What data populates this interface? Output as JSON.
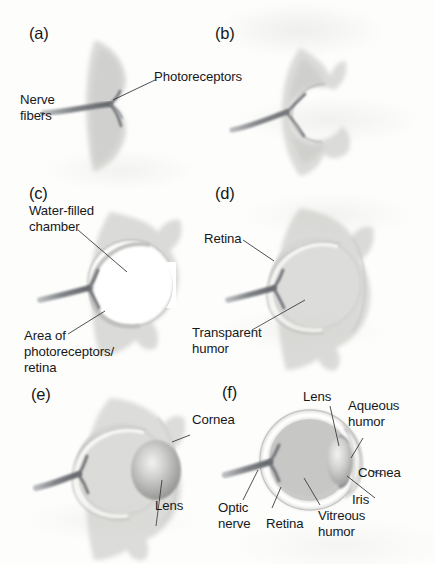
{
  "figure": {
    "background_color": "#fdfdfc",
    "ink_color": "#16181a",
    "tissue_color": "#d8d8d6",
    "nerve_color": "#6f7276"
  },
  "panels": [
    {
      "id": "a",
      "letter": "(a)",
      "stage": "flat patch of photoreceptors",
      "labels": [
        {
          "name": "nerve-fibers",
          "text": "Nerve\nfibers"
        },
        {
          "name": "photoreceptors",
          "text": "Photoreceptors"
        }
      ]
    },
    {
      "id": "b",
      "letter": "(b)",
      "stage": "cupped photoreceptor sheet",
      "labels": []
    },
    {
      "id": "c",
      "letter": "(c)",
      "stage": "pinhole eye with water-filled chamber",
      "labels": [
        {
          "name": "water-filled-chamber",
          "text": "Water-filled\nchamber"
        },
        {
          "name": "area-of-photoreceptors-retina",
          "text": "Area of\nphotoreceptors/\nretina"
        }
      ]
    },
    {
      "id": "d",
      "letter": "(d)",
      "stage": "chamber filled with transparent humor",
      "labels": [
        {
          "name": "retina",
          "text": "Retina"
        },
        {
          "name": "transparent-humor",
          "text": "Transparent\nhumor"
        }
      ]
    },
    {
      "id": "e",
      "letter": "(e)",
      "stage": "eye with lens and cornea",
      "labels": [
        {
          "name": "cornea",
          "text": "Cornea"
        },
        {
          "name": "lens",
          "text": "Lens"
        }
      ]
    },
    {
      "id": "f",
      "letter": "(f)",
      "stage": "complex camera eye",
      "labels": [
        {
          "name": "lens",
          "text": "Lens"
        },
        {
          "name": "aqueous-humor",
          "text": "Aqueous\nhumor"
        },
        {
          "name": "cornea",
          "text": "Cornea"
        },
        {
          "name": "iris",
          "text": "Iris"
        },
        {
          "name": "vitreous-humor",
          "text": "Vitreous\nhumor"
        },
        {
          "name": "retina",
          "text": "Retina"
        },
        {
          "name": "optic-nerve",
          "text": "Optic\nnerve"
        }
      ]
    }
  ],
  "text": {
    "a_letter": "(a)",
    "b_letter": "(b)",
    "c_letter": "(c)",
    "d_letter": "(d)",
    "e_letter": "(e)",
    "f_letter": "(f)",
    "nerve_fibers_l1": "Nerve",
    "nerve_fibers_l2": "fibers",
    "photoreceptors": "Photoreceptors",
    "water_filled_l1": "Water-filled",
    "water_filled_l2": "chamber",
    "area_of_l1": "Area of",
    "area_of_l2": "photoreceptors/",
    "area_of_l3": "retina",
    "retina_d": "Retina",
    "transparent_l1": "Transparent",
    "transparent_l2": "humor",
    "cornea_e": "Cornea",
    "lens_e": "Lens",
    "lens_f": "Lens",
    "aqueous_l1": "Aqueous",
    "aqueous_l2": "humor",
    "cornea_f": "Cornea",
    "iris_f": "Iris",
    "vitreous_l1": "Vitreous",
    "vitreous_l2": "humor",
    "retina_f": "Retina",
    "optic_l1": "Optic",
    "optic_l2": "nerve"
  }
}
